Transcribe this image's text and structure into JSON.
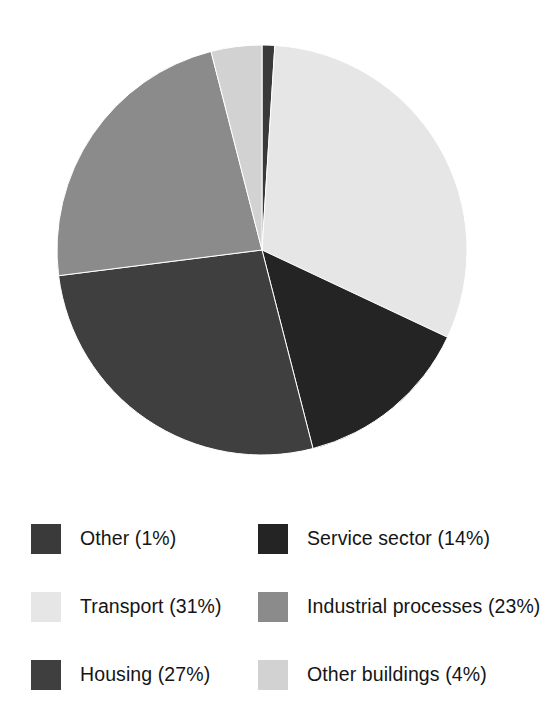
{
  "chart_data": {
    "type": "pie",
    "title": "",
    "subtitle": "",
    "xlabel": "",
    "ylabel": "",
    "grid": false,
    "legend_position": "bottom",
    "legend_columns": 2,
    "units": "percent",
    "start_angle_deg": 0,
    "direction": "clockwise",
    "center": {
      "x": 262,
      "y": 250
    },
    "radius": 205,
    "categories": [
      "Other",
      "Transport",
      "Service sector",
      "Housing",
      "Industrial processes",
      "Other buildings"
    ],
    "values": [
      1,
      31,
      14,
      27,
      23,
      4
    ],
    "slices": [
      {
        "label": "Other",
        "value": 1,
        "percent_text": "(1%)",
        "legend_text": "Other (1%)",
        "color": "#3a3a3a",
        "start_angle_deg": 0,
        "end_angle_deg": 3.6,
        "legend_cell": "row1-left"
      },
      {
        "label": "Transport",
        "value": 31,
        "percent_text": "(31%)",
        "legend_text": "Transport (31%)",
        "color": "#e6e6e6",
        "start_angle_deg": 3.6,
        "end_angle_deg": 115.2,
        "legend_cell": "row2-left"
      },
      {
        "label": "Service sector",
        "value": 14,
        "percent_text": "(14%)",
        "legend_text": "Service sector (14%)",
        "color": "#242424",
        "start_angle_deg": 115.2,
        "end_angle_deg": 165.6,
        "legend_cell": "row1-right"
      },
      {
        "label": "Housing",
        "value": 27,
        "percent_text": "(27%)",
        "legend_text": "Housing (27%)",
        "color": "#3f3f3f",
        "start_angle_deg": 165.6,
        "end_angle_deg": 262.8,
        "legend_cell": "row3-left"
      },
      {
        "label": "Industrial processes",
        "value": 23,
        "percent_text": "(23%)",
        "legend_text": "Industrial processes (23%)",
        "color": "#8b8b8b",
        "start_angle_deg": 262.8,
        "end_angle_deg": 345.6,
        "legend_cell": "row2-right"
      },
      {
        "label": "Other buildings",
        "value": 4,
        "percent_text": "(4%)",
        "legend_text": "Other buildings (4%)",
        "color": "#d2d2d2",
        "start_angle_deg": 345.6,
        "end_angle_deg": 360,
        "legend_cell": "row3-right"
      }
    ]
  },
  "legend": {
    "rows": [
      {
        "left": {
          "label": "Other (1%)",
          "color": "#3a3a3a"
        },
        "right": {
          "label": "Service sector (14%)",
          "color": "#242424"
        }
      },
      {
        "left": {
          "label": "Transport (31%)",
          "color": "#e6e6e6"
        },
        "right": {
          "label": "Industrial processes (23%)",
          "color": "#8b8b8b"
        }
      },
      {
        "left": {
          "label": "Housing (27%)",
          "color": "#3f3f3f"
        },
        "right": {
          "label": "Other buildings (4%)",
          "color": "#d2d2d2"
        }
      }
    ]
  },
  "colors": {
    "background": "#ffffff",
    "text": "#151515",
    "slice_outline": "#ffffff"
  }
}
